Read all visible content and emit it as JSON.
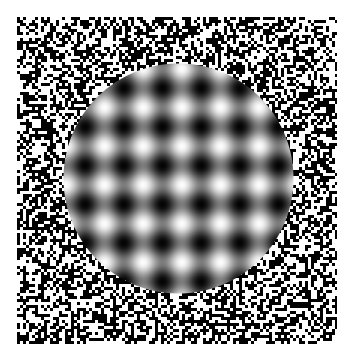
{
  "image": {
    "width": 353,
    "height": 363,
    "background": "#ffffff",
    "description": "Optical illusion: circular sinusoidal grid of bright and dark blobs surrounded by a square field of random black-and-white pixel noise"
  },
  "noise_field": {
    "x0": 17,
    "y0": 17,
    "x1": 337,
    "y1": 344,
    "cell_size": 3,
    "colors": [
      "#000000",
      "#ffffff"
    ],
    "density": 0.5
  },
  "circle": {
    "cx": 178.5,
    "cy": 178.5,
    "r": 115.5,
    "pattern": "cos-lattice",
    "period": 38.7,
    "origin_x": 104,
    "origin_y": 107,
    "min_gray": 4,
    "max_gray": 252
  }
}
